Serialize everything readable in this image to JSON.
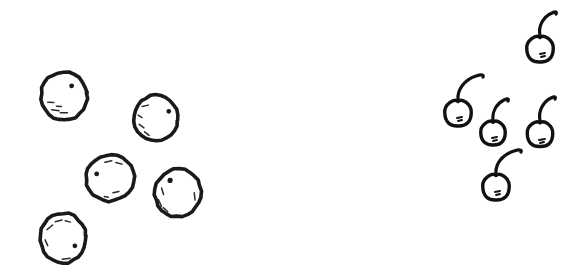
{
  "scene": {
    "title": "Hand-drawn objects comparison",
    "background_color": "#ffffff",
    "ink_color": "#1a1a1a",
    "width": 575,
    "height": 273,
    "style": "hand-drawn sketch, black ink on white",
    "left_group": {
      "name": "balls",
      "label": "balls",
      "count": 5,
      "description": "five hand-drawn circles with small dash and dot speckle marks inside",
      "items": [
        {
          "id": "ball-1",
          "label": "ball",
          "cx": 64,
          "cy": 96,
          "rx": 23,
          "ry": 24,
          "rotation": -8,
          "dot": {
            "x": 73,
            "y": 87,
            "r": 2.4
          },
          "dashes": [
            {
              "x1": 47,
              "y1": 100,
              "x2": 53,
              "y2": 101
            },
            {
              "x1": 50,
              "y1": 108,
              "x2": 57,
              "y2": 110
            },
            {
              "x1": 58,
              "y1": 112,
              "x2": 65,
              "y2": 113
            },
            {
              "x1": 55,
              "y1": 105,
              "x2": 60,
              "y2": 106
            }
          ]
        },
        {
          "id": "ball-2",
          "label": "ball",
          "cx": 156,
          "cy": 118,
          "rx": 22,
          "ry": 23,
          "rotation": 6,
          "dot": {
            "x": 168,
            "y": 110,
            "r": 2.4
          },
          "dashes": [
            {
              "x1": 141,
              "y1": 108,
              "x2": 147,
              "y2": 106
            },
            {
              "x1": 138,
              "y1": 117,
              "x2": 142,
              "y2": 119
            },
            {
              "x1": 140,
              "y1": 126,
              "x2": 145,
              "y2": 129
            },
            {
              "x1": 146,
              "y1": 133,
              "x2": 151,
              "y2": 136
            }
          ]
        },
        {
          "id": "ball-3",
          "label": "ball",
          "cx": 110,
          "cy": 178,
          "rx": 24,
          "ry": 23,
          "rotation": -4,
          "dot": {
            "x": 97,
            "y": 173,
            "r": 2.4
          },
          "dashes": [
            {
              "x1": 106,
              "y1": 162,
              "x2": 113,
              "y2": 161
            },
            {
              "x1": 117,
              "y1": 163,
              "x2": 123,
              "y2": 165
            },
            {
              "x1": 112,
              "y1": 193,
              "x2": 118,
              "y2": 192
            },
            {
              "x1": 103,
              "y1": 196,
              "x2": 107,
              "y2": 197
            }
          ]
        },
        {
          "id": "ball-4",
          "label": "ball",
          "cx": 178,
          "cy": 193,
          "rx": 23,
          "ry": 24,
          "rotation": 10,
          "dot": {
            "x": 168,
            "y": 182,
            "r": 2.6
          },
          "dashes": [
            {
              "x1": 161,
              "y1": 191,
              "x2": 164,
              "y2": 197
            },
            {
              "x1": 160,
              "y1": 203,
              "x2": 164,
              "y2": 209
            },
            {
              "x1": 166,
              "y1": 210,
              "x2": 171,
              "y2": 213
            },
            {
              "x1": 194,
              "y1": 190,
              "x2": 196,
              "y2": 197
            }
          ]
        },
        {
          "id": "ball-5",
          "label": "ball",
          "cx": 63,
          "cy": 238,
          "rx": 23,
          "ry": 25,
          "rotation": -6,
          "dot": {
            "x": 74,
            "y": 247,
            "r": 2.4
          },
          "dashes": [
            {
              "x1": 48,
              "y1": 228,
              "x2": 54,
              "y2": 224
            },
            {
              "x1": 57,
              "y1": 221,
              "x2": 64,
              "y2": 220
            },
            {
              "x1": 67,
              "y1": 221,
              "x2": 72,
              "y2": 223
            },
            {
              "x1": 45,
              "y1": 238,
              "x2": 47,
              "y2": 244
            },
            {
              "x1": 60,
              "y1": 259,
              "x2": 68,
              "y2": 259
            }
          ]
        }
      ]
    },
    "right_group": {
      "name": "cherries",
      "label": "cherries",
      "count": 5,
      "description": "five hand-drawn cherries, each with a curved stem rising from the top and a small highlight mark on the fruit",
      "items": [
        {
          "id": "cherry-1",
          "label": "cherry",
          "cx": 540,
          "cy": 48,
          "rx": 13,
          "ry": 13.5,
          "stem": "M540,36 C538,26 543,17 552,13 C556,11 557,12 556,14",
          "mark": [
            {
              "x1": 540,
              "y1": 54,
              "x2": 545,
              "y2": 53
            },
            {
              "x1": 541,
              "y1": 57,
              "x2": 545,
              "y2": 56
            }
          ]
        },
        {
          "id": "cherry-2",
          "label": "cherry",
          "cx": 458,
          "cy": 112,
          "rx": 13,
          "ry": 13.5,
          "stem": "M458,100 C457,90 464,80 476,76 C482,74 484,75 483,77",
          "mark": [
            {
              "x1": 457,
              "y1": 118,
              "x2": 462,
              "y2": 117
            },
            {
              "x1": 458,
              "y1": 121,
              "x2": 462,
              "y2": 120
            }
          ]
        },
        {
          "id": "cherry-3",
          "label": "cherry",
          "cx": 493,
          "cy": 132,
          "rx": 12,
          "ry": 12.5,
          "stem": "M493,121 C492,112 496,104 504,100 C508,98 509,99 508,101",
          "mark": [
            {
              "x1": 492,
              "y1": 138,
              "x2": 497,
              "y2": 137
            },
            {
              "x1": 493,
              "y1": 141,
              "x2": 497,
              "y2": 140
            }
          ]
        },
        {
          "id": "cherry-4",
          "label": "cherry",
          "cx": 540,
          "cy": 133,
          "rx": 12.5,
          "ry": 13,
          "stem": "M540,121 C538,111 543,102 551,98 C555,96 556,97 555,99",
          "mark": [
            {
              "x1": 539,
              "y1": 140,
              "x2": 545,
              "y2": 139
            },
            {
              "x1": 540,
              "y1": 143,
              "x2": 544,
              "y2": 142
            }
          ]
        },
        {
          "id": "cherry-5",
          "label": "cherry",
          "cx": 496,
          "cy": 186,
          "rx": 13,
          "ry": 13.5,
          "stem": "M496,174 C495,164 502,155 514,151 C520,149 522,150 521,152",
          "mark": [
            {
              "x1": 495,
              "y1": 192,
              "x2": 500,
              "y2": 191
            },
            {
              "x1": 496,
              "y1": 195,
              "x2": 500,
              "y2": 194
            }
          ]
        }
      ]
    }
  }
}
